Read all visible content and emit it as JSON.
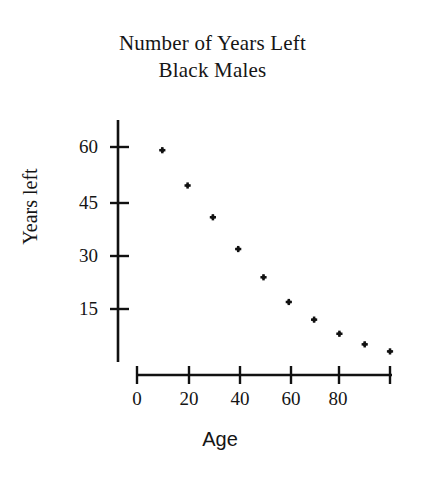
{
  "chart_data": {
    "type": "scatter",
    "title": "Number of Years Left",
    "subtitle": "Black Males",
    "title_lines": [
      "Number of Years Left",
      "Black Males"
    ],
    "xlabel": "Age",
    "ylabel": "Years left",
    "xlim": [
      0,
      100
    ],
    "ylim": [
      0,
      68
    ],
    "grid": false,
    "legend": "none",
    "marker": "plus",
    "marker_color": "#111111",
    "axis_color": "#111111",
    "background_color": "#ffffff",
    "xticks": [
      0,
      20,
      40,
      60,
      80,
      100
    ],
    "xtick_labels": [
      "0",
      "20",
      "40",
      "60",
      "80",
      ""
    ],
    "yticks": [
      15,
      30,
      45,
      60
    ],
    "ytick_labels": [
      "15",
      "30",
      "45",
      "60"
    ],
    "x": [
      10,
      20,
      30,
      40,
      50,
      60,
      70,
      80,
      90,
      100
    ],
    "values": [
      60,
      50,
      41,
      32,
      24,
      17,
      12,
      8,
      5,
      3
    ],
    "points": [
      {
        "x": 10,
        "y": 60
      },
      {
        "x": 20,
        "y": 50
      },
      {
        "x": 30,
        "y": 41
      },
      {
        "x": 40,
        "y": 32
      },
      {
        "x": 50,
        "y": 24
      },
      {
        "x": 60,
        "y": 17
      },
      {
        "x": 70,
        "y": 12
      },
      {
        "x": 80,
        "y": 8
      },
      {
        "x": 90,
        "y": 5
      },
      {
        "x": 100,
        "y": 3
      }
    ]
  }
}
